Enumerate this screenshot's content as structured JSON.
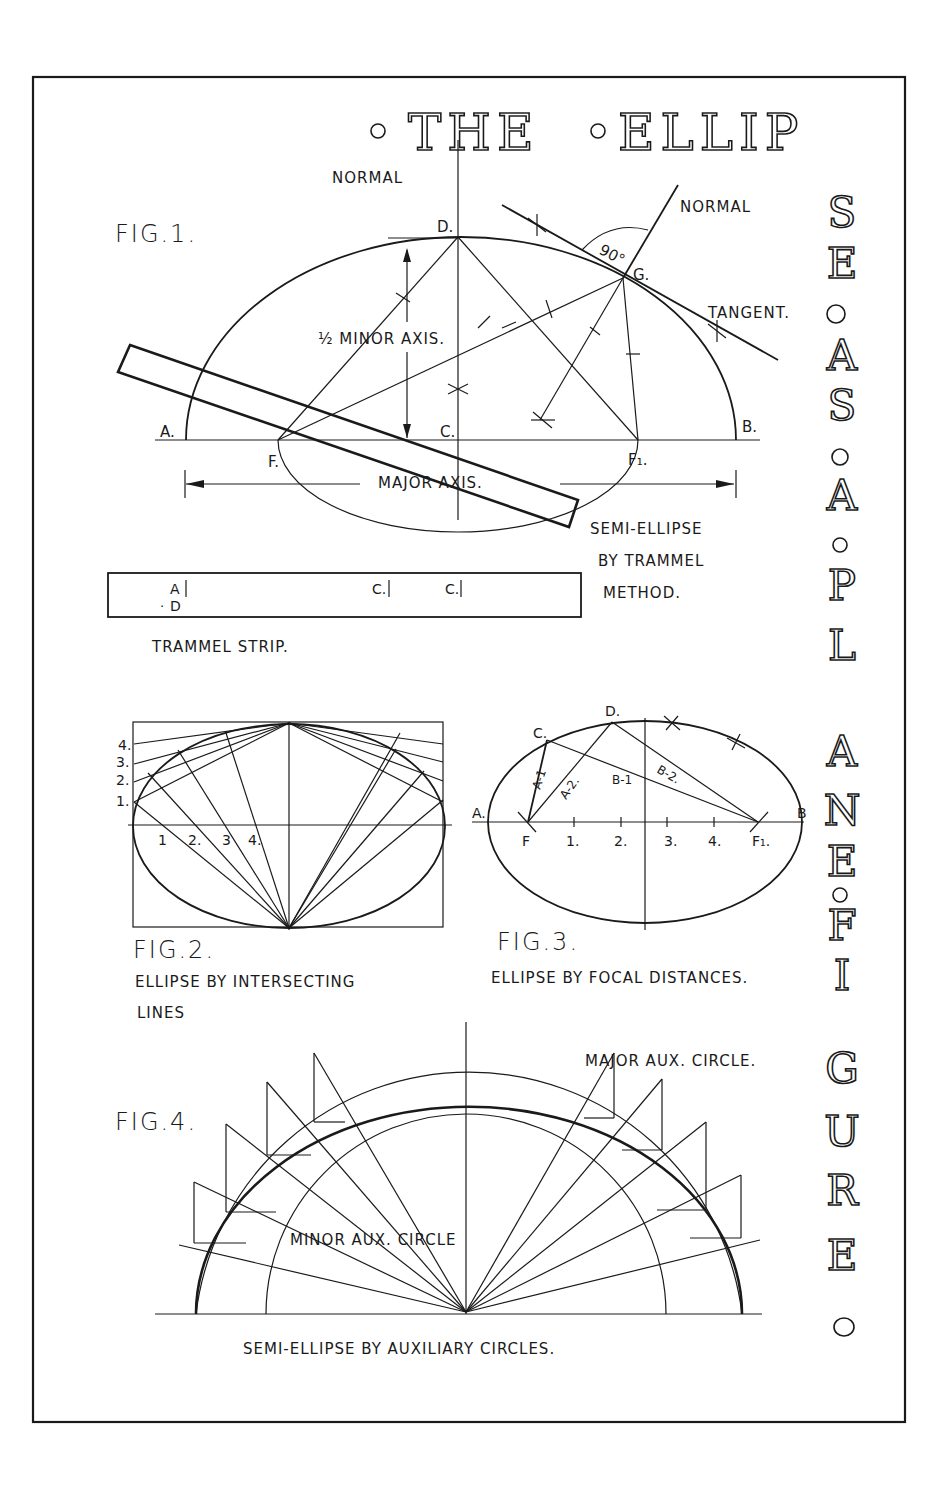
{
  "title": {
    "horizontal": [
      "THE",
      "ELLIP"
    ],
    "vertical_letters": [
      "S",
      "E",
      "○",
      "A",
      "S",
      "○",
      "A",
      "○",
      "P",
      "L",
      "A",
      "N",
      "E",
      "○",
      "F",
      "I",
      "G",
      "U",
      "R",
      "E",
      "○"
    ],
    "full_text": "THE ELLIPSE AS A PLANE FIGURE"
  },
  "fig1": {
    "label": "FIG.1.",
    "normal_top": "NORMAL",
    "normal_right": "NORMAL",
    "angle": "90°",
    "point_d": "D.",
    "point_g": "G.",
    "tangent": "TANGENT.",
    "half_minor_axis": "½ MINOR AXIS.",
    "point_a": "A.",
    "point_c": "C.",
    "point_b": "B.",
    "point_f": "F.",
    "point_f1": "F₁.",
    "major_axis": "MAJOR AXIS.",
    "caption": [
      "SEMI-ELLIPSE",
      "BY TRAMMEL",
      "METHOD."
    ]
  },
  "trammel": {
    "marks": [
      "A",
      "D",
      "C.",
      "C."
    ],
    "caption": "TRAMMEL STRIP."
  },
  "fig2": {
    "label": "FIG.2.",
    "left_ticks": [
      "4.",
      "3.",
      "2.",
      "1."
    ],
    "axis_ticks": [
      "1",
      "2.",
      "3",
      "4."
    ],
    "caption": [
      "ELLIPSE BY INTERSECTING",
      "LINES"
    ]
  },
  "fig3": {
    "label": "FIG.3.",
    "point_a": "A.",
    "point_b": "B",
    "point_c": "C.",
    "point_d": "D.",
    "point_f": "F",
    "point_f1": "F₁.",
    "axis_ticks": [
      "1.",
      "2.",
      "3.",
      "4."
    ],
    "segments": [
      "A-1",
      "A-2.",
      "B-1",
      "B-2."
    ],
    "caption": "ELLIPSE BY FOCAL DISTANCES."
  },
  "fig4": {
    "label": "FIG.4.",
    "major_circle": "MAJOR AUX. CIRCLE.",
    "minor_circle": "MINOR AUX. CIRCLE",
    "caption": "SEMI-ELLIPSE BY AUXILIARY CIRCLES."
  }
}
